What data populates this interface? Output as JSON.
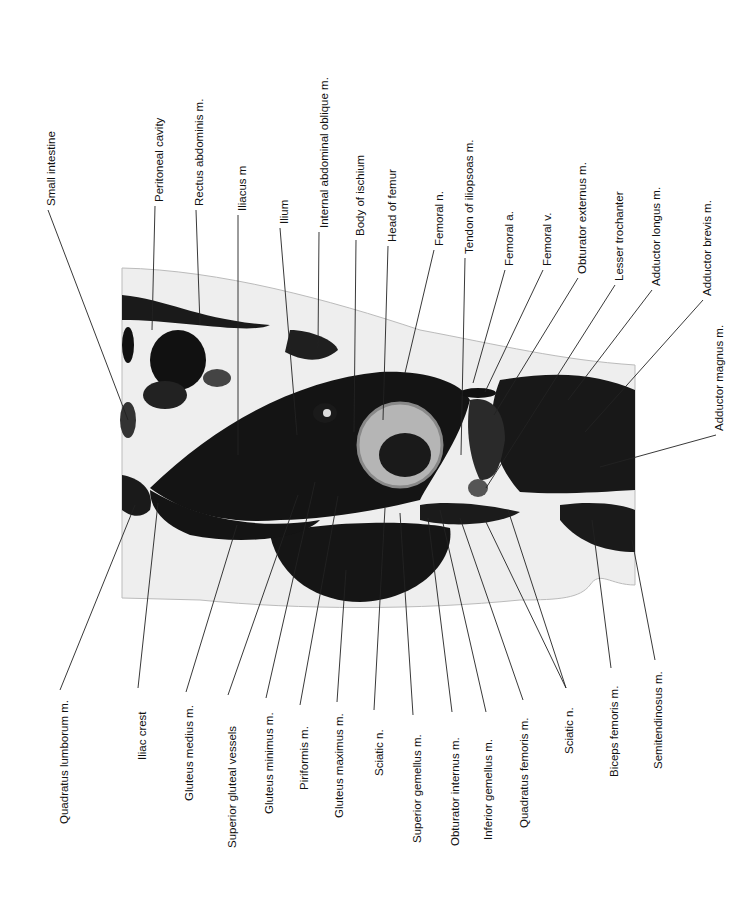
{
  "figure": {
    "colors": {
      "background": "#ffffff",
      "tissue_dark": "#141414",
      "tissue_mid": "#555555",
      "tissue_light": "#e6e6e6",
      "line": "#222222"
    }
  },
  "labels_top": [
    {
      "text": "Small intestine",
      "x": 52,
      "ty": 128,
      "lx": 48,
      "ly1": 210,
      "tx": 128,
      "tyEnd": 420
    },
    {
      "text": "Peritoneal cavity",
      "x": 160,
      "ty": 125,
      "lx": 155,
      "ly1": 206,
      "tx": 152,
      "tyEnd": 330
    },
    {
      "text": "Rectus abdominis m.",
      "x": 200,
      "ty": 108,
      "lx": 196,
      "ly1": 210,
      "tx": 200,
      "tyEnd": 325
    },
    {
      "text": "Iliacus m",
      "x": 243,
      "ty": 165,
      "lx": 238,
      "ly1": 215,
      "tx": 238,
      "tyEnd": 455
    },
    {
      "text": "Ilium",
      "x": 285,
      "ty": 210,
      "lx": 280,
      "ly1": 228,
      "tx": 297,
      "tyEnd": 435
    },
    {
      "text": "Internal abdominal oblique m.",
      "x": 325,
      "ty": 80,
      "lx": 319,
      "ly1": 232,
      "tx": 318,
      "tyEnd": 348
    },
    {
      "text": "Body of ischium",
      "x": 361,
      "ty": 152,
      "lx": 356,
      "ly1": 240,
      "tx": 354,
      "tyEnd": 432
    },
    {
      "text": "Head of femur",
      "x": 393,
      "ty": 168,
      "lx": 388,
      "ly1": 246,
      "tx": 383,
      "tyEnd": 420
    },
    {
      "text": "Femoral n.",
      "x": 440,
      "ty": 195,
      "lx": 434,
      "ly1": 250,
      "tx": 405,
      "tyEnd": 373
    },
    {
      "text": "Tendon of iliopsoas m.",
      "x": 470,
      "ty": 120,
      "lx": 465,
      "ly1": 258,
      "tx": 461,
      "tyEnd": 455
    },
    {
      "text": "Femoral a.",
      "x": 510,
      "ty": 225,
      "lx": 505,
      "ly1": 270,
      "tx": 473,
      "tyEnd": 383
    },
    {
      "text": "Femoral v.",
      "x": 548,
      "ty": 225,
      "lx": 543,
      "ly1": 270,
      "tx": 485,
      "tyEnd": 392
    },
    {
      "text": "Obturator externus m.",
      "x": 583,
      "ty": 168,
      "lx": 578,
      "ly1": 278,
      "tx": 494,
      "tyEnd": 415
    },
    {
      "text": "Lesser trochanter",
      "x": 620,
      "ty": 190,
      "lx": 615,
      "ly1": 285,
      "tx": 486,
      "tyEnd": 488
    },
    {
      "text": "Adductor longus m.",
      "x": 657,
      "ty": 190,
      "lx": 652,
      "ly1": 290,
      "tx": 568,
      "tyEnd": 400
    },
    {
      "text": "Adductor brevis m.",
      "x": 708,
      "ty": 195,
      "lx": 703,
      "ly1": 300,
      "tx": 585,
      "tyEnd": 432
    },
    {
      "text": "Adductor magnus m.",
      "x": 720,
      "ty": 420,
      "lx": 716,
      "ly1": 435,
      "tx": 600,
      "tyEnd": 467
    }
  ],
  "labels_bottom": [
    {
      "text": "Quadratus lumborum m.",
      "x": 65,
      "ty": 820,
      "lx": 60,
      "ly1": 690,
      "tx": 135,
      "tyEnd": 505
    },
    {
      "text": "Iliac crest",
      "x": 143,
      "ty": 745,
      "lx": 138,
      "ly1": 688,
      "tx": 158,
      "tyEnd": 503
    },
    {
      "text": "Gluteus medius m.",
      "x": 190,
      "ty": 790,
      "lx": 186,
      "ly1": 692,
      "tx": 237,
      "tyEnd": 525
    },
    {
      "text": "Superior gluteal vessels",
      "x": 233,
      "ty": 820,
      "lx": 228,
      "ly1": 695,
      "tx": 298,
      "tyEnd": 495
    },
    {
      "text": "Gluteus minimus m.",
      "x": 270,
      "ty": 806,
      "lx": 266,
      "ly1": 698,
      "tx": 315,
      "tyEnd": 482
    },
    {
      "text": "Piriformis m.",
      "x": 305,
      "ty": 768,
      "lx": 300,
      "ly1": 705,
      "tx": 338,
      "tyEnd": 496
    },
    {
      "text": "Gluteus maximus m.",
      "x": 340,
      "ty": 815,
      "lx": 337,
      "ly1": 702,
      "tx": 346,
      "tyEnd": 570
    },
    {
      "text": "Sciatic n.",
      "x": 380,
      "ty": 760,
      "lx": 374,
      "ly1": 710,
      "tx": 385,
      "tyEnd": 508
    },
    {
      "text": "Superior gemellus m.",
      "x": 418,
      "ty": 826,
      "lx": 413,
      "ly1": 715,
      "tx": 400,
      "tyEnd": 513
    },
    {
      "text": "Obturator internus m.",
      "x": 456,
      "ty": 822,
      "lx": 452,
      "ly1": 712,
      "tx": 428,
      "tyEnd": 518
    },
    {
      "text": "Inferior gemellus m.",
      "x": 489,
      "ty": 815,
      "lx": 486,
      "ly1": 712,
      "tx": 440,
      "tyEnd": 510
    },
    {
      "text": "Quadratus femoris m.",
      "x": 525,
      "ty": 810,
      "lx": 523,
      "ly1": 700,
      "tx": 460,
      "tyEnd": 518
    },
    {
      "text": "Sciatic n.",
      "x": 570,
      "ty": 735,
      "lx": 566,
      "ly1": 688,
      "tx": 485,
      "tyEnd": 520
    },
    {
      "text": "Biceps femoris m.",
      "x": 615,
      "ty": 762,
      "lx": 611,
      "ly1": 668,
      "tx": 592,
      "tyEnd": 520
    },
    {
      "text": "Semitendinosus m.",
      "x": 659,
      "ty": 762,
      "lx": 655,
      "ly1": 660,
      "tx": 632,
      "tyEnd": 540
    }
  ],
  "extra_sciatic_line": {
    "x1": 566,
    "y1": 688,
    "x2": 508,
    "y2": 510
  }
}
